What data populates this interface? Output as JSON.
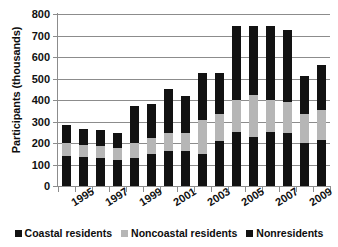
{
  "chart_data": {
    "type": "bar",
    "stacked": true,
    "title": "",
    "xlabel": "",
    "ylabel": "Participants (thousands)",
    "ylim": [
      0,
      800
    ],
    "ytick_step": 100,
    "ytick_labels": [
      "800",
      "700",
      "600",
      "500",
      "400",
      "300",
      "200",
      "100",
      "0"
    ],
    "grid": true,
    "legend_position": "bottom",
    "categories": [
      "1994",
      "1995",
      "1996",
      "1997",
      "1998",
      "1999",
      "2000",
      "2001",
      "2002",
      "2003",
      "2004",
      "2005",
      "2006",
      "2007",
      "2008",
      "2009"
    ],
    "xtick_labels_shown": [
      "1995",
      "1997",
      "1999",
      "2001",
      "2003",
      "2005",
      "2007",
      "2009"
    ],
    "series": [
      {
        "name": "Coastal residents",
        "color": "#121212",
        "values": [
          140,
          135,
          130,
          120,
          130,
          150,
          165,
          165,
          150,
          210,
          250,
          230,
          250,
          245,
          200,
          215
        ]
      },
      {
        "name": "Noncoastal residents",
        "color": "#b6b6b6",
        "values": [
          60,
          55,
          55,
          55,
          70,
          75,
          80,
          80,
          155,
          125,
          150,
          195,
          150,
          145,
          135,
          140
        ]
      },
      {
        "name": "Nonresidents",
        "color": "#121212",
        "values": [
          85,
          75,
          75,
          70,
          170,
          155,
          205,
          175,
          220,
          190,
          345,
          320,
          345,
          335,
          175,
          210
        ]
      }
    ],
    "totals": [
      285,
      265,
      260,
      245,
      370,
      380,
      450,
      420,
      525,
      525,
      745,
      745,
      745,
      725,
      510,
      565
    ]
  },
  "legend": {
    "items": [
      {
        "label": "Coastal residents",
        "color": "#121212",
        "swatch": "square-marker-icon"
      },
      {
        "label": "Noncoastal residents",
        "color": "#b6b6b6",
        "swatch": "square-marker-icon"
      },
      {
        "label": "Nonresidents",
        "color": "#121212",
        "swatch": "square-marker-icon"
      }
    ]
  }
}
